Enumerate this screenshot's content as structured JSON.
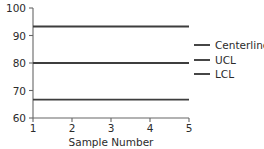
{
  "chart_data": {
    "type": "line",
    "title": "",
    "subtitle": "",
    "xlabel": "Sample Number",
    "ylabel": "",
    "xlim": [
      1,
      5
    ],
    "ylim": [
      60,
      100
    ],
    "x_ticks": [
      1,
      2,
      3,
      4,
      5
    ],
    "x_tick_labels": [
      "1",
      "2",
      "3",
      "4",
      "5"
    ],
    "y_ticks": [
      60,
      70,
      80,
      90,
      100
    ],
    "y_tick_labels": [
      "60",
      "70",
      "80",
      "90",
      "100"
    ],
    "grid": false,
    "legend_position": "right",
    "x": [
      1,
      5
    ],
    "series": [
      {
        "name": "UCL",
        "values": [
          93.3,
          93.3
        ],
        "color": "#3d3d3d",
        "style": "solid"
      },
      {
        "name": "Centerline",
        "values": [
          80.0,
          80.0
        ],
        "color": "#3d3d3d",
        "style": "solid"
      },
      {
        "name": "LCL",
        "values": [
          66.7,
          66.7
        ],
        "color": "#3d3d3d",
        "style": "solid"
      }
    ],
    "legend_entries": [
      "Centerline",
      "UCL",
      "LCL"
    ],
    "annotations": []
  },
  "legend": {
    "entries": [
      {
        "label": "Centerline",
        "color": "#3d3d3d"
      },
      {
        "label": "UCL",
        "color": "#3d3d3d"
      },
      {
        "label": "LCL",
        "color": "#3d3d3d"
      }
    ]
  },
  "axes": {
    "x_title": "Sample Number",
    "y_title": "",
    "x_labels": [
      "1",
      "2",
      "3",
      "4",
      "5"
    ],
    "y_labels": [
      "100",
      "90",
      "80",
      "70",
      "60"
    ]
  },
  "colors": {
    "background": "#ffffff",
    "axis": "#666666",
    "series": "#3d3d3d",
    "text": "#2b2b2b"
  }
}
